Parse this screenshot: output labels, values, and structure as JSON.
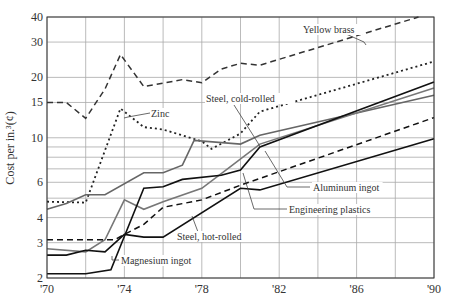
{
  "chart_data": {
    "type": "line",
    "title": "",
    "xlabel": "",
    "ylabel": "Cost per in.³(¢)",
    "yscale": "log",
    "ylim": [
      2,
      40
    ],
    "xlim": [
      1970,
      1990
    ],
    "grid": true,
    "legend": "inline annotations",
    "x_ticks": [
      "'70",
      "'74",
      "'78",
      "'82",
      "'86",
      "'90"
    ],
    "x_tick_values": [
      1970,
      1974,
      1978,
      1982,
      1986,
      1990
    ],
    "y_ticks": [
      "2",
      "3",
      "4",
      "6",
      "10",
      "15",
      "20",
      "30",
      "40"
    ],
    "y_tick_values": [
      2,
      3,
      4,
      6,
      10,
      15,
      20,
      30,
      40
    ],
    "y_gridlines": [
      2,
      3,
      4,
      5,
      6,
      7,
      8,
      9,
      10,
      15,
      20,
      30,
      40
    ],
    "series": [
      {
        "name": "Yellow brass",
        "style": "dashed",
        "color": "#333333",
        "points": [
          [
            1970,
            15
          ],
          [
            1971,
            15
          ],
          [
            1972,
            12.5
          ],
          [
            1973,
            17.5
          ],
          [
            1973.8,
            26
          ],
          [
            1975,
            18
          ],
          [
            1977,
            19.5
          ],
          [
            1978,
            18.8
          ],
          [
            1979,
            22
          ],
          [
            1980,
            23.5
          ],
          [
            1981,
            23
          ],
          [
            1989.2,
            40
          ]
        ]
      },
      {
        "name": "Zinc",
        "style": "dotted",
        "color": "#222222",
        "points": [
          [
            1970,
            4.8
          ],
          [
            1972,
            4.75
          ],
          [
            1973.8,
            14
          ],
          [
            1975,
            11.3
          ],
          [
            1976,
            11
          ],
          [
            1978,
            9.6
          ],
          [
            1978.5,
            8.8
          ],
          [
            1980,
            10.5
          ],
          [
            1981,
            13.5
          ],
          [
            1990,
            24
          ]
        ]
      },
      {
        "name": "Steel, cold-rolled",
        "style": "solid",
        "color": "#666666",
        "points": [
          [
            1970,
            4.4
          ],
          [
            1971,
            4.7
          ],
          [
            1972,
            5.2
          ],
          [
            1973,
            5.2
          ],
          [
            1975,
            6.7
          ],
          [
            1976,
            6.7
          ],
          [
            1977,
            7.3
          ],
          [
            1977.6,
            9.7
          ],
          [
            1980,
            9.3
          ],
          [
            1981,
            10.3
          ],
          [
            1990,
            16.3
          ]
        ]
      },
      {
        "name": "Aluminum ingot",
        "style": "solid",
        "color": "#777777",
        "points": [
          [
            1970,
            2.8
          ],
          [
            1972,
            2.7
          ],
          [
            1973,
            3.1
          ],
          [
            1974,
            4.9
          ],
          [
            1975,
            4.4
          ],
          [
            1976,
            4.8
          ],
          [
            1978,
            5.6
          ],
          [
            1979.5,
            7.2
          ],
          [
            1981,
            9.3
          ],
          [
            1990,
            17.7
          ]
        ]
      },
      {
        "name": "Magnesium ingot",
        "style": "solid",
        "color": "#111111",
        "points": [
          [
            1970,
            2.1
          ],
          [
            1972,
            2.1
          ],
          [
            1973.3,
            2.2
          ],
          [
            1975,
            5.6
          ],
          [
            1976,
            5.7
          ],
          [
            1977,
            6.2
          ],
          [
            1979,
            6.5
          ],
          [
            1980,
            6.9
          ],
          [
            1981,
            9.0
          ],
          [
            1990,
            19
          ]
        ]
      },
      {
        "name": "Steel, hot-rolled",
        "style": "solid",
        "color": "#111111",
        "points": [
          [
            1970,
            2.6
          ],
          [
            1971,
            2.6
          ],
          [
            1972,
            2.75
          ],
          [
            1973,
            2.7
          ],
          [
            1974,
            3.3
          ],
          [
            1975,
            3.2
          ],
          [
            1976,
            3.2
          ],
          [
            1980,
            5.6
          ],
          [
            1981,
            5.5
          ],
          [
            1990,
            9.9
          ]
        ]
      },
      {
        "name": "Engineering plastics",
        "style": "dashed",
        "color": "#111111",
        "points": [
          [
            1970,
            3.1
          ],
          [
            1973.5,
            3.1
          ],
          [
            1974,
            3.3
          ],
          [
            1975,
            3.7
          ],
          [
            1976,
            4.5
          ],
          [
            1978,
            4.9
          ],
          [
            1980,
            5.8
          ],
          [
            1990,
            12.6
          ]
        ]
      }
    ],
    "annotations": [
      {
        "text": "Yellow brass",
        "x": 303,
        "y": 33
      },
      {
        "text": "Zinc",
        "x": 151,
        "y": 117
      },
      {
        "text": "Steel, cold-rolled",
        "x": 206,
        "y": 102
      },
      {
        "text": "Aluminum ingot",
        "x": 313,
        "y": 191
      },
      {
        "text": "Engineering plastics",
        "x": 289,
        "y": 213
      },
      {
        "text": "Steel, hot-rolled",
        "x": 177,
        "y": 240
      },
      {
        "text": "Magnesium ingot",
        "x": 121,
        "y": 264
      }
    ]
  }
}
